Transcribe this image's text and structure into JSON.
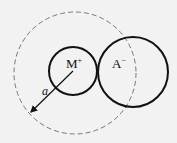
{
  "diagram": {
    "cation": {
      "label": "M",
      "charge": "+"
    },
    "anion": {
      "label": "A",
      "charge": "−"
    },
    "radius_label": "a",
    "colors": {
      "background": "#f2f2f2",
      "stroke": "#111111",
      "dashed": "#777777"
    }
  }
}
